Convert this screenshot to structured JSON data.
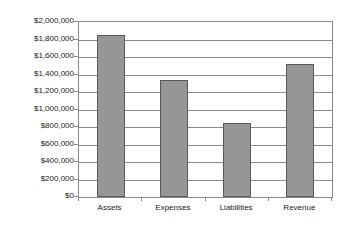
{
  "chart_data": {
    "type": "bar",
    "title": "",
    "subtitle": "",
    "xlabel": "",
    "ylabel": "",
    "categories": [
      "Assets",
      "Expenses",
      "Liabilities",
      "Revenue"
    ],
    "values": [
      1855000,
      1340000,
      845000,
      1520000
    ],
    "series": [
      {
        "name": "",
        "values": [
          1855000,
          1340000,
          845000,
          1520000
        ]
      }
    ],
    "ylim": [
      0,
      2000000
    ],
    "ytick_step": 200000,
    "ytick_labels": [
      "$2,000,000",
      "$1,800,000",
      "$1,600,000",
      "$1,400,000",
      "$1,200,000",
      "$1,000,000",
      "$800,000",
      "$600,000",
      "$400,000",
      "$200,000",
      "$0"
    ],
    "ytick_values": [
      2000000,
      1800000,
      1600000,
      1400000,
      1200000,
      1000000,
      800000,
      600000,
      400000,
      200000,
      0
    ],
    "grid": true,
    "grid_axis": "y",
    "legend": false,
    "legend_position": "none",
    "annotations": [],
    "colors": {
      "bar_fill": "#969696",
      "bar_border": "#595959",
      "gridline": "#8a8a8a",
      "axis": "#8a8a8a",
      "text": "#1a1a1a",
      "background": "#ffffff"
    }
  }
}
